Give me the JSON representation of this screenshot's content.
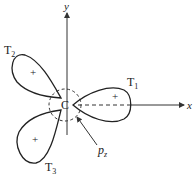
{
  "diagram": {
    "axes": {
      "x_label": "x",
      "y_label": "y"
    },
    "center_label": "C",
    "lobes": [
      {
        "name": "T",
        "sub": "1",
        "sign": "+"
      },
      {
        "name": "T",
        "sub": "2",
        "sign": "+"
      },
      {
        "name": "T",
        "sub": "3",
        "sign": "+"
      }
    ],
    "pz_label": {
      "main": "p",
      "sub": "z"
    }
  }
}
